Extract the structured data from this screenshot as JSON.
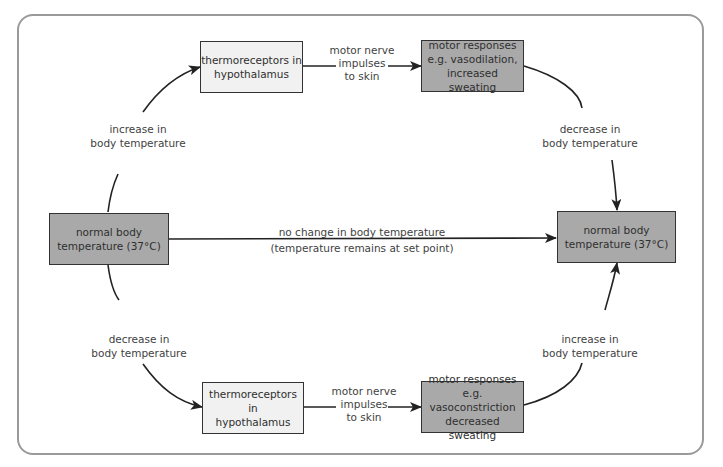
{
  "diagram": {
    "boxes": {
      "normal_left": {
        "lines": [
          "normal body",
          "temperature (37°C)"
        ]
      },
      "normal_right": {
        "lines": [
          "normal body",
          "temperature (37°C)"
        ]
      },
      "thermo_top": {
        "lines": [
          "thermoreceptors in",
          "hypothalamus"
        ]
      },
      "motor_top": {
        "lines": [
          "motor responses",
          "e.g. vasodilation,",
          "increased sweating"
        ]
      },
      "thermo_bottom": {
        "lines": [
          "thermoreceptors in",
          "hypothalamus"
        ]
      },
      "motor_bottom": {
        "lines": [
          "motor responses",
          "e.g. vasoconstriction",
          "decreased sweating"
        ]
      }
    },
    "labels": {
      "increase_left": {
        "lines": [
          "increase in",
          "body temperature"
        ]
      },
      "decrease_right": {
        "lines": [
          "decrease in",
          "body temperature"
        ]
      },
      "decrease_left": {
        "lines": [
          "decrease in",
          "body temperature"
        ]
      },
      "increase_right": {
        "lines": [
          "increase in",
          "body temperature"
        ]
      },
      "nerve_top": {
        "lines": [
          "motor nerve",
          "impulses",
          "to skin"
        ]
      },
      "nerve_bottom": {
        "lines": [
          "motor nerve",
          "impulses",
          "to skin"
        ]
      },
      "no_change": {
        "lines": [
          "no change in body temperature",
          "(temperature remains at set point)"
        ]
      }
    },
    "colors": {
      "frame": "#9a9a9a",
      "light_box": "#f1f1f1",
      "dark_box": "#a9a9a9",
      "line": "#222222"
    }
  }
}
